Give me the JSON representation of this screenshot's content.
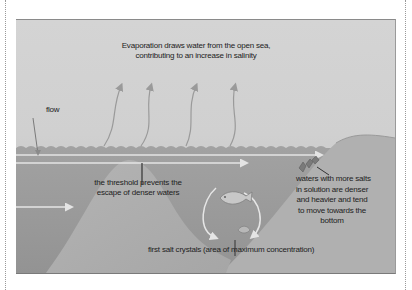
{
  "diagram": {
    "labels": {
      "evaporation_line1": "Evaporation draws water from the open sea,",
      "evaporation_line2": "contributing to an increase in salinity",
      "flow": "flow",
      "threshold_line1": "the threshold prevents the",
      "threshold_line2": "escape of denser waters",
      "crystals": "first salt crystals (area of maximum concentration)",
      "salts_line1": "waters with more salts",
      "salts_line2": "in solution are denser",
      "salts_line3": "and heavier and tend",
      "salts_line4": "to move towards the",
      "salts_line5": "bottom"
    },
    "icons": [
      "evaporation-arrow-icon",
      "flow-arrow-icon",
      "fish-icon",
      "circulation-arrow-icon",
      "salt-crystal-icon"
    ],
    "colors": {
      "sky_top": "#d2d2d2",
      "sky_bottom": "#c2c2c2",
      "water": "#9c9c9c",
      "seabed": "#adadad",
      "arrow": "#e4e4e4",
      "text": "#222222"
    }
  }
}
